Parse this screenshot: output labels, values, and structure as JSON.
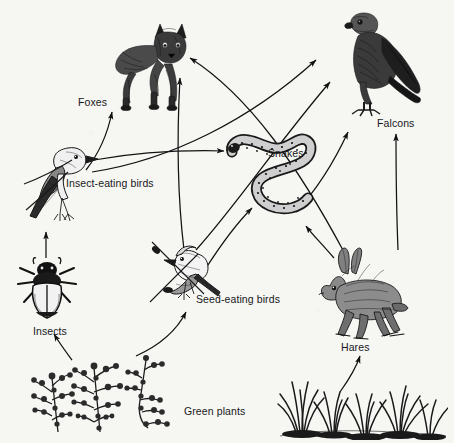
{
  "diagram": {
    "background_color": "#f6f6f3",
    "ink_color": "#121212",
    "style": "black and white line engraving illustration"
  },
  "labels": {
    "foxes": "Foxes",
    "falcons": "Falcons",
    "snakes": "Snakes",
    "insect_eating_birds": "Insect-eating birds",
    "seed_eating_birds": "Seed-eating birds",
    "insects": "Insects",
    "hares": "Hares",
    "green_plants": "Green plants"
  },
  "organisms": [
    {
      "id": "foxes",
      "label": "Foxes",
      "icon": "fox-illustration",
      "x": 108,
      "y": 18,
      "w": 88,
      "h": 92,
      "label_x": 78,
      "label_y": 96,
      "trophic_level": "tertiary consumer"
    },
    {
      "id": "falcons",
      "label": "Falcons",
      "icon": "falcon-illustration",
      "x": 330,
      "y": 12,
      "w": 96,
      "h": 110,
      "label_x": 377,
      "label_y": 118,
      "trophic_level": "tertiary consumer"
    },
    {
      "id": "snakes",
      "label": "Snakes",
      "icon": "snake-illustration",
      "x": 228,
      "y": 128,
      "w": 92,
      "h": 100,
      "label_x": 268,
      "label_y": 148,
      "trophic_level": "secondary consumer"
    },
    {
      "id": "insect_eating_birds",
      "label": "Insect-eating birds",
      "icon": "bird-illustration",
      "x": 24,
      "y": 138,
      "w": 84,
      "h": 86,
      "label_x": 66,
      "label_y": 178,
      "trophic_level": "secondary consumer"
    },
    {
      "id": "seed_eating_birds",
      "label": "Seed-eating birds",
      "icon": "bird-illustration",
      "x": 148,
      "y": 238,
      "w": 84,
      "h": 82,
      "label_x": 196,
      "label_y": 294,
      "trophic_level": "primary consumer"
    },
    {
      "id": "insects",
      "label": "Insects",
      "icon": "beetle-illustration",
      "x": 18,
      "y": 258,
      "w": 62,
      "h": 66,
      "label_x": 33,
      "label_y": 326,
      "trophic_level": "primary consumer"
    },
    {
      "id": "hares",
      "label": "Hares",
      "icon": "hare-illustration",
      "x": 318,
      "y": 248,
      "w": 92,
      "h": 92,
      "label_x": 341,
      "label_y": 342,
      "trophic_level": "primary consumer"
    },
    {
      "id": "green_plants",
      "label": "Green plants",
      "icon": "plants-illustration",
      "x": 30,
      "y": 340,
      "w": 150,
      "h": 90,
      "label_x": 184,
      "label_y": 406,
      "trophic_level": "producer"
    }
  ],
  "arrows": [
    {
      "id": "insects-to-insect-eating-birds",
      "from": "insects",
      "to": "insect_eating_birds"
    },
    {
      "id": "green-plants-to-insects",
      "from": "green_plants",
      "to": "insects"
    },
    {
      "id": "green-plants-to-seed-eating-birds",
      "from": "green_plants",
      "to": "seed_eating_birds"
    },
    {
      "id": "green-plants-to-hares",
      "from": "green_plants",
      "to": "hares"
    },
    {
      "id": "insect-eating-birds-to-foxes",
      "from": "insect_eating_birds",
      "to": "foxes"
    },
    {
      "id": "insect-eating-birds-to-falcons",
      "from": "insect_eating_birds",
      "to": "falcons"
    },
    {
      "id": "insect-eating-birds-to-snakes",
      "from": "insect_eating_birds",
      "to": "snakes"
    },
    {
      "id": "seed-eating-birds-to-foxes",
      "from": "seed_eating_birds",
      "to": "foxes"
    },
    {
      "id": "seed-eating-birds-to-falcons",
      "from": "seed_eating_birds",
      "to": "falcons"
    },
    {
      "id": "seed-eating-birds-to-snakes",
      "from": "seed_eating_birds",
      "to": "snakes"
    },
    {
      "id": "hares-to-foxes",
      "from": "hares",
      "to": "foxes"
    },
    {
      "id": "hares-to-falcons",
      "from": "hares",
      "to": "falcons"
    },
    {
      "id": "hares-to-snakes",
      "from": "hares",
      "to": "snakes"
    },
    {
      "id": "snakes-to-falcons",
      "from": "snakes",
      "to": "falcons"
    }
  ]
}
